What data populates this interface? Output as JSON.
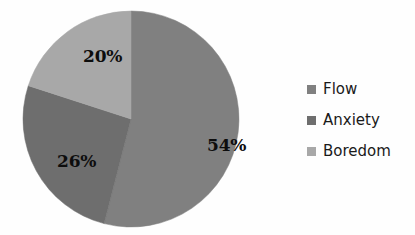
{
  "chart_data": {
    "type": "pie",
    "title": "",
    "categories": [
      "Flow",
      "Anxiety",
      "Boredom"
    ],
    "values": [
      54,
      26,
      20
    ],
    "unit": "%",
    "data_labels": [
      "54%",
      "26%",
      "20%"
    ],
    "colors": [
      "#808080",
      "#6e6e6e",
      "#a8a8a8"
    ],
    "legend_position": "right",
    "grid": false,
    "start_angle_deg": 0,
    "direction": "clockwise",
    "slices": [
      {
        "name": "Flow",
        "value": 54,
        "label": "54%",
        "color": "#808080",
        "start_deg": 0,
        "end_deg": 194.4
      },
      {
        "name": "Anxiety",
        "value": 26,
        "label": "26%",
        "color": "#6e6e6e",
        "start_deg": 194.4,
        "end_deg": 288.0
      },
      {
        "name": "Boredom",
        "value": 20,
        "label": "20%",
        "color": "#a8a8a8",
        "start_deg": 288.0,
        "end_deg": 360.0
      }
    ]
  },
  "legend": {
    "items": [
      {
        "label": "Flow",
        "color": "#808080",
        "swatch_icon": "legend-swatch-icon"
      },
      {
        "label": "Anxiety",
        "color": "#6e6e6e",
        "swatch_icon": "legend-swatch-icon"
      },
      {
        "label": "Boredom",
        "color": "#a8a8a8",
        "swatch_icon": "legend-swatch-icon"
      }
    ]
  },
  "canvas": {
    "background": "#fefefe",
    "label_color": "#0d0d0d"
  }
}
